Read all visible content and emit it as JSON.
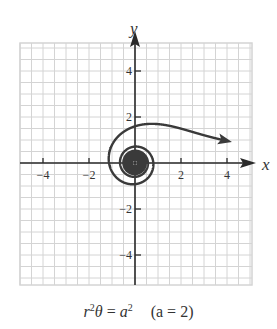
{
  "chart_data": {
    "type": "line",
    "title": "",
    "caption": "r²θ = a²   (a = 2)",
    "equation": "r^2 θ = a^2",
    "parameter": "a = 2",
    "xlabel": "x",
    "ylabel": "y",
    "xlim": [
      -5,
      5
    ],
    "ylim": [
      -5,
      5.2
    ],
    "xticks": [
      -4,
      -2,
      2,
      4
    ],
    "yticks": [
      -4,
      -2,
      2,
      4
    ],
    "xtick_labels": [
      "−4",
      "−2",
      "2",
      "4"
    ],
    "ytick_labels": [
      "−4",
      "−2",
      "2",
      "4"
    ],
    "grid": true,
    "grid_minor_step": 0.5,
    "series": [
      {
        "name": "lituus r = 2/√θ",
        "polar": true,
        "a": 2,
        "theta_range": [
          0.25,
          200
        ],
        "color": "#3a3a3a",
        "arrow_at_start": true
      }
    ]
  },
  "labels": {
    "x_axis": "x",
    "y_axis": "y",
    "caption_lhs_r": "r",
    "caption_lhs_exp": "2",
    "caption_lhs_theta": "θ",
    "caption_eq": " = ",
    "caption_rhs_a": "a",
    "caption_rhs_exp": "2",
    "caption_param": "(a = 2)"
  },
  "colors": {
    "grid": "#d4d4d4",
    "axis": "#2a2a2a",
    "curve": "#3a3a3a",
    "text": "#333333"
  }
}
